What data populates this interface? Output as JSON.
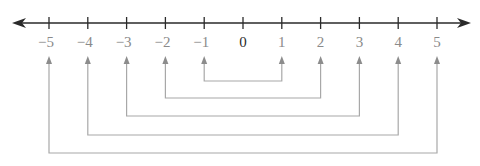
{
  "figure": {
    "type": "number-line-opposites",
    "axis": {
      "min": -5,
      "max": 5,
      "arrows": "both",
      "color": "#2a2a2a"
    },
    "ticks": [
      {
        "value": -5,
        "label": "−5"
      },
      {
        "value": -4,
        "label": "−4"
      },
      {
        "value": -3,
        "label": "−3"
      },
      {
        "value": -2,
        "label": "−2"
      },
      {
        "value": -1,
        "label": "−1"
      },
      {
        "value": 0,
        "label": "0"
      },
      {
        "value": 1,
        "label": "1"
      },
      {
        "value": 2,
        "label": "2"
      },
      {
        "value": 3,
        "label": "3"
      },
      {
        "value": 4,
        "label": "4"
      },
      {
        "value": 5,
        "label": "5"
      }
    ],
    "pairs": [
      {
        "left": -1,
        "right": 1
      },
      {
        "left": -2,
        "right": 2
      },
      {
        "left": -3,
        "right": 3
      },
      {
        "left": -4,
        "right": 4
      },
      {
        "left": -5,
        "right": 5
      }
    ],
    "colors": {
      "axis": "#2a2a2a",
      "label": "#8a8a8a",
      "zero_label": "#2a2a2a",
      "connector": "#a8a8a8",
      "arrowhead": "#8c8c8c"
    }
  }
}
